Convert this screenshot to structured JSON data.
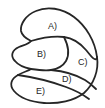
{
  "diagram": {
    "shape_name": "kidney-bean-outline",
    "stroke_color": "#262626",
    "fill_color": "#ffffff",
    "background_color": "#ffffff",
    "stroke_width": 1.8,
    "regions": [
      {
        "id": "A",
        "label": "A)",
        "position": "top"
      },
      {
        "id": "B",
        "label": "B)",
        "position": "middle-left"
      },
      {
        "id": "C",
        "label": "C)",
        "position": "middle-right"
      },
      {
        "id": "D",
        "label": "D)",
        "position": "lower-middle"
      },
      {
        "id": "E",
        "label": "E)",
        "position": "bottom"
      }
    ]
  }
}
